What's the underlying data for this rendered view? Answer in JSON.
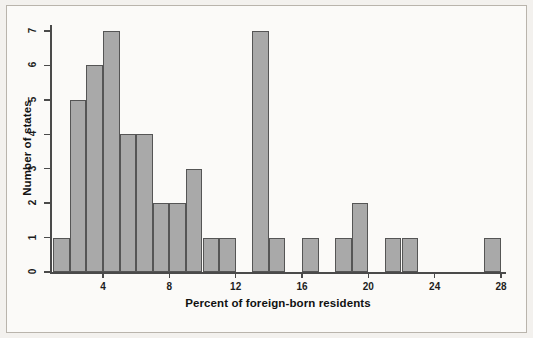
{
  "chart_data": {
    "type": "bar",
    "title": "",
    "xlabel": "Percent of foreign-born residents",
    "ylabel": "Number of states",
    "xlim": [
      1,
      28
    ],
    "ylim": [
      0,
      7
    ],
    "bin_width": 1,
    "grid": false,
    "legend": null,
    "bar_color": "#a9a9a9",
    "bar_edge_color": "#555555",
    "axis_color": "#4a4a4a",
    "xticks": [
      4,
      8,
      12,
      16,
      20,
      24,
      28
    ],
    "xtick_labels": [
      "4",
      "8",
      "12",
      "16",
      "20",
      "24",
      "28"
    ],
    "yticks": [
      0,
      1,
      2,
      3,
      4,
      5,
      6,
      7
    ],
    "ytick_labels": [
      "0",
      "1",
      "2",
      "3",
      "4",
      "5",
      "6",
      "7"
    ],
    "bins": [
      {
        "start": 1,
        "end": 2,
        "count": 1
      },
      {
        "start": 2,
        "end": 3,
        "count": 5
      },
      {
        "start": 3,
        "end": 4,
        "count": 6
      },
      {
        "start": 4,
        "end": 5,
        "count": 7
      },
      {
        "start": 5,
        "end": 6,
        "count": 4
      },
      {
        "start": 6,
        "end": 7,
        "count": 4
      },
      {
        "start": 7,
        "end": 8,
        "count": 2
      },
      {
        "start": 8,
        "end": 9,
        "count": 2
      },
      {
        "start": 9,
        "end": 10,
        "count": 3
      },
      {
        "start": 10,
        "end": 11,
        "count": 1
      },
      {
        "start": 11,
        "end": 12,
        "count": 1
      },
      {
        "start": 12,
        "end": 13,
        "count": 0
      },
      {
        "start": 13,
        "end": 14,
        "count": 7
      },
      {
        "start": 14,
        "end": 15,
        "count": 1
      },
      {
        "start": 15,
        "end": 16,
        "count": 0
      },
      {
        "start": 16,
        "end": 17,
        "count": 1
      },
      {
        "start": 17,
        "end": 18,
        "count": 0
      },
      {
        "start": 18,
        "end": 19,
        "count": 1
      },
      {
        "start": 19,
        "end": 20,
        "count": 2
      },
      {
        "start": 20,
        "end": 21,
        "count": 0
      },
      {
        "start": 21,
        "end": 22,
        "count": 1
      },
      {
        "start": 22,
        "end": 23,
        "count": 1
      },
      {
        "start": 23,
        "end": 24,
        "count": 0
      },
      {
        "start": 24,
        "end": 25,
        "count": 0
      },
      {
        "start": 25,
        "end": 26,
        "count": 0
      },
      {
        "start": 26,
        "end": 27,
        "count": 0
      },
      {
        "start": 27,
        "end": 28,
        "count": 1
      }
    ],
    "categories": [
      "1-2",
      "2-3",
      "3-4",
      "4-5",
      "5-6",
      "6-7",
      "7-8",
      "8-9",
      "9-10",
      "10-11",
      "11-12",
      "12-13",
      "13-14",
      "14-15",
      "15-16",
      "16-17",
      "17-18",
      "18-19",
      "19-20",
      "20-21",
      "21-22",
      "22-23",
      "23-24",
      "24-25",
      "25-26",
      "26-27",
      "27-28"
    ],
    "values": [
      1,
      5,
      6,
      7,
      4,
      4,
      2,
      2,
      3,
      1,
      1,
      0,
      7,
      1,
      0,
      1,
      0,
      1,
      2,
      0,
      1,
      1,
      0,
      0,
      0,
      0,
      1
    ]
  }
}
